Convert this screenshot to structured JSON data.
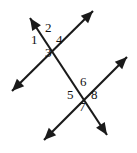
{
  "figure": {
    "background_color": "#ffffff",
    "line_color": "#1a1a1a",
    "label_color": "#111111",
    "width": 137,
    "height": 153
  },
  "lines": [
    {
      "id": "transversal",
      "name": "transversal-line",
      "description": "Steep line running from upper-left to lower-right through both intersections",
      "x1": 30,
      "y1": 18,
      "x2": 107,
      "y2": 135,
      "arrow_start": true,
      "arrow_end": true
    },
    {
      "id": "line-upper",
      "name": "upper-parallel-line",
      "description": "Line from lower-left to upper-right crossing the transversal at the upper intersection",
      "x1": 12,
      "y1": 91,
      "x2": 93,
      "y2": 11,
      "arrow_start": true,
      "arrow_end": true
    },
    {
      "id": "line-lower",
      "name": "lower-parallel-line",
      "description": "Line from lower-left to upper-right crossing the transversal at the lower intersection",
      "x1": 44,
      "y1": 140,
      "x2": 127,
      "y2": 57,
      "arrow_start": true,
      "arrow_end": true
    }
  ],
  "intersections": [
    {
      "id": "upper",
      "name": "upper-intersection-point",
      "x": 50,
      "y": 45
    },
    {
      "id": "lower",
      "name": "lower-intersection-point",
      "x": 85,
      "y": 99
    }
  ],
  "angle_labels": [
    {
      "id": "a1",
      "text": "1",
      "x": 34,
      "y": 40,
      "intersection": "upper",
      "position": "left"
    },
    {
      "id": "a2",
      "text": "2",
      "x": 48,
      "y": 28,
      "intersection": "upper",
      "position": "top"
    },
    {
      "id": "a3",
      "text": "3",
      "x": 48,
      "y": 53,
      "intersection": "upper",
      "position": "bottom"
    },
    {
      "id": "a4",
      "text": "4",
      "x": 59,
      "y": 40,
      "intersection": "upper",
      "position": "right"
    },
    {
      "id": "a5",
      "text": "5",
      "x": 70,
      "y": 95,
      "intersection": "lower",
      "position": "left"
    },
    {
      "id": "a6",
      "text": "6",
      "x": 83,
      "y": 82,
      "intersection": "lower",
      "position": "top"
    },
    {
      "id": "a7",
      "text": "7",
      "x": 82,
      "y": 107,
      "intersection": "lower",
      "position": "bottom"
    },
    {
      "id": "a8",
      "text": "8",
      "x": 94,
      "y": 95,
      "intersection": "lower",
      "position": "right"
    }
  ]
}
